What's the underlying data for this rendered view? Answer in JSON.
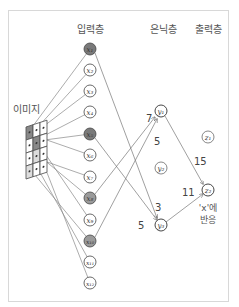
{
  "layers": {
    "input": "입력층",
    "hidden": "은닉층",
    "output": "출력층"
  },
  "image_label": "이미지",
  "input_nodes": [
    {
      "id": "x1",
      "label": "x₁",
      "active": true
    },
    {
      "id": "x2",
      "label": "x₂",
      "active": false
    },
    {
      "id": "x3",
      "label": "x₃",
      "active": false
    },
    {
      "id": "x4",
      "label": "x₄",
      "active": false
    },
    {
      "id": "x5",
      "label": "x₅",
      "active": true
    },
    {
      "id": "x6",
      "label": "x₆",
      "active": false
    },
    {
      "id": "x7",
      "label": "x₇",
      "active": false
    },
    {
      "id": "x8",
      "label": "x₈",
      "active": true
    },
    {
      "id": "x9",
      "label": "x₉",
      "active": false
    },
    {
      "id": "x10",
      "label": "x₁₀",
      "active": true
    },
    {
      "id": "x11",
      "label": "x₁₁",
      "active": false
    },
    {
      "id": "x12",
      "label": "x₁₂",
      "active": false
    }
  ],
  "hidden_nodes": [
    {
      "id": "y1",
      "label": "y₁"
    },
    {
      "id": "y2",
      "label": "y₂"
    },
    {
      "id": "y3",
      "label": "y₃"
    }
  ],
  "output_nodes": [
    {
      "id": "z1",
      "label": "z₁"
    },
    {
      "id": "z2",
      "label": "z₂"
    }
  ],
  "weights": {
    "x8_y1": "7",
    "x10_y1": "5",
    "x1_y3": "3",
    "x5_y3": "5",
    "y1_z2": "15",
    "y3_z2": "11"
  },
  "output_note": {
    "line1": "'x'에",
    "line2": "반응"
  },
  "colors": {
    "active_node": "#7a7a7a",
    "inactive_node": "#ffffff",
    "edge": "#777777",
    "frame": "#d8d8d8"
  }
}
